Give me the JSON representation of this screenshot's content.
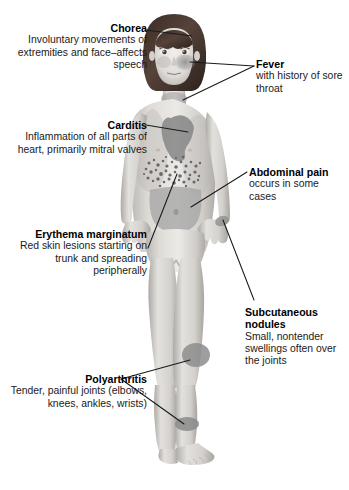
{
  "image": {
    "kind": "medical-illustration",
    "subject": "Child figure showing signs of acute rheumatic fever",
    "background_color": "#ffffff",
    "leader_line_color": "#1a1a1a"
  },
  "callouts": [
    {
      "id": "chorea",
      "title": "Chorea",
      "body": "Involuntary movements of extremities and face–affects speech",
      "align": "right",
      "side": "left"
    },
    {
      "id": "carditis",
      "title": "Carditis",
      "body": "Inflammation of all parts of heart, primarily mitral valves",
      "align": "right",
      "side": "left"
    },
    {
      "id": "erythema",
      "title": "Erythema marginatum",
      "body": "Red skin lesions starting on trunk and spreading peripherally",
      "align": "right",
      "side": "left"
    },
    {
      "id": "polyarthritis",
      "title": "Polyarthritis",
      "body": "Tender, painful joints (elbows, knees, ankles, wrists)",
      "align": "right",
      "side": "left"
    },
    {
      "id": "fever",
      "title": "Fever",
      "body": "with history of sore throat",
      "align": "left",
      "side": "right"
    },
    {
      "id": "abdominal",
      "title": "Abdominal pain",
      "body": "occurs in some cases",
      "align": "left",
      "side": "right"
    },
    {
      "id": "nodules",
      "title": "Subcutaneous nodules",
      "body": "Small, nontender swellings often over the joints",
      "align": "left",
      "side": "right"
    }
  ],
  "anatomy_markers": [
    {
      "name": "hair",
      "label": "bob-haircut",
      "color": "#4a3a31"
    },
    {
      "name": "face-flush",
      "label": "fever-cheek-flush",
      "color": "#8e8e8e"
    },
    {
      "name": "throat",
      "label": "sore-throat-region",
      "color": "#9a9a9a"
    },
    {
      "name": "heart",
      "label": "carditis-heart-shape",
      "color": "#8b8b8b"
    },
    {
      "name": "rash",
      "label": "erythema-marginatum-speckles",
      "color": "#6d6d6d"
    },
    {
      "name": "abdomen",
      "label": "abdominal-pain-region",
      "color": "#a2a2a2"
    },
    {
      "name": "knee",
      "label": "polyarthritis-knee-patch",
      "color": "#8d8d8d"
    },
    {
      "name": "ankle",
      "label": "polyarthritis-ankle-patch",
      "color": "#8d8d8d"
    },
    {
      "name": "wrist",
      "label": "subcutaneous-nodules-wrist",
      "color": "#8d8d8d"
    },
    {
      "name": "skin",
      "label": "body-skin-tone",
      "color": "#d9d6d2"
    }
  ]
}
